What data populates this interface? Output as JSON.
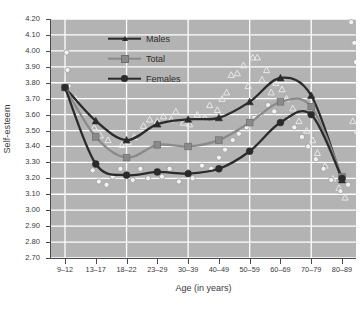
{
  "chart_data": {
    "type": "line",
    "title": "",
    "xlabel": "Age (in years)",
    "ylabel": "Self-esteem",
    "ylim": [
      2.7,
      4.2
    ],
    "ytick_step": 0.1,
    "ytick_labels": [
      "4.20",
      "4.10",
      "4.00",
      "3.90",
      "3.80",
      "3.70",
      "3.60",
      "3.50",
      "3.40",
      "3.30",
      "3.20",
      "3.10",
      "3.00",
      "2.90",
      "2.80",
      "2.70"
    ],
    "categories": [
      "9–12",
      "13–17",
      "18–22",
      "23–29",
      "30–39",
      "40–49",
      "50–59",
      "60–69",
      "70–79",
      "80–89"
    ],
    "grid": true,
    "grid_color": "#ffffff",
    "plot_background": "#b3b3b3",
    "legend_position": "top-center",
    "series": [
      {
        "name": "Males",
        "marker": "triangle",
        "color": "#2b2b2b",
        "values": [
          3.77,
          3.56,
          3.44,
          3.54,
          3.57,
          3.58,
          3.68,
          3.83,
          3.72,
          3.19
        ]
      },
      {
        "name": "Total",
        "marker": "square",
        "color": "#8a8a8a",
        "values": [
          3.77,
          3.46,
          3.33,
          3.41,
          3.4,
          3.44,
          3.55,
          3.68,
          3.65,
          3.21
        ]
      },
      {
        "name": "Females",
        "marker": "circle",
        "color": "#2b2b2b",
        "values": [
          3.77,
          3.29,
          3.22,
          3.24,
          3.23,
          3.26,
          3.37,
          3.55,
          3.6,
          3.2
        ]
      }
    ],
    "scatter": {
      "note": "individual observation markers (open triangles and open circles) around the fitted curves",
      "open_triangle": [
        [
          0.1,
          3.74
        ],
        [
          0.35,
          3.7
        ],
        [
          0.95,
          3.52
        ],
        [
          1.15,
          3.47
        ],
        [
          1.4,
          3.44
        ],
        [
          1.85,
          3.41
        ],
        [
          2.05,
          3.43
        ],
        [
          2.25,
          3.46
        ],
        [
          2.55,
          3.53
        ],
        [
          2.75,
          3.57
        ],
        [
          3.0,
          3.56
        ],
        [
          3.2,
          3.59
        ],
        [
          3.45,
          3.57
        ],
        [
          3.6,
          3.62
        ],
        [
          3.85,
          3.55
        ],
        [
          4.05,
          3.54
        ],
        [
          4.3,
          3.6
        ],
        [
          4.55,
          3.58
        ],
        [
          4.7,
          3.66
        ],
        [
          4.95,
          3.63
        ],
        [
          5.1,
          3.7
        ],
        [
          5.25,
          3.74
        ],
        [
          5.4,
          3.85
        ],
        [
          5.6,
          3.86
        ],
        [
          5.8,
          3.91
        ],
        [
          5.95,
          3.78
        ],
        [
          6.1,
          3.96
        ],
        [
          6.25,
          3.96
        ],
        [
          6.4,
          3.82
        ],
        [
          6.55,
          3.88
        ],
        [
          6.7,
          3.74
        ],
        [
          6.85,
          3.8
        ],
        [
          7.05,
          3.76
        ],
        [
          7.2,
          3.7
        ],
        [
          7.4,
          3.64
        ],
        [
          7.6,
          3.56
        ],
        [
          7.85,
          3.5
        ],
        [
          8.05,
          3.44
        ],
        [
          8.2,
          3.36
        ],
        [
          8.45,
          3.28
        ],
        [
          8.7,
          3.2
        ],
        [
          8.9,
          3.14
        ],
        [
          9.1,
          3.08
        ],
        [
          9.35,
          3.56
        ],
        [
          9.5,
          3.5
        ]
      ],
      "open_circle": [
        [
          0.05,
          3.99
        ],
        [
          0.08,
          3.88
        ],
        [
          0.12,
          3.78
        ],
        [
          0.9,
          3.25
        ],
        [
          1.1,
          3.18
        ],
        [
          1.35,
          3.16
        ],
        [
          1.55,
          3.21
        ],
        [
          1.8,
          3.26
        ],
        [
          2.0,
          3.23
        ],
        [
          2.2,
          3.19
        ],
        [
          2.45,
          3.26
        ],
        [
          2.7,
          3.2
        ],
        [
          2.95,
          3.24
        ],
        [
          3.15,
          3.21
        ],
        [
          3.4,
          3.26
        ],
        [
          3.7,
          3.18
        ],
        [
          3.95,
          3.24
        ],
        [
          4.15,
          3.2
        ],
        [
          4.45,
          3.28
        ],
        [
          4.75,
          3.26
        ],
        [
          5.0,
          3.33
        ],
        [
          5.2,
          3.38
        ],
        [
          5.45,
          3.44
        ],
        [
          5.65,
          3.48
        ],
        [
          5.9,
          3.52
        ],
        [
          6.15,
          3.58
        ],
        [
          6.35,
          3.6
        ],
        [
          6.6,
          3.66
        ],
        [
          6.8,
          3.62
        ],
        [
          7.0,
          3.68
        ],
        [
          7.25,
          3.58
        ],
        [
          7.45,
          3.52
        ],
        [
          7.7,
          3.46
        ],
        [
          7.9,
          3.4
        ],
        [
          8.15,
          3.32
        ],
        [
          8.4,
          3.26
        ],
        [
          8.65,
          3.19
        ],
        [
          8.95,
          3.12
        ],
        [
          9.3,
          4.18
        ],
        [
          9.4,
          4.05
        ],
        [
          9.45,
          3.93
        ],
        [
          9.55,
          3.38
        ],
        [
          9.2,
          3.16
        ]
      ]
    }
  },
  "legend": {
    "items": [
      {
        "label": "Males",
        "icon": "triangle-marker-icon"
      },
      {
        "label": "Total",
        "icon": "square-marker-icon"
      },
      {
        "label": "Females",
        "icon": "circle-marker-icon"
      }
    ]
  }
}
